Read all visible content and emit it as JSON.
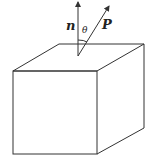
{
  "diagram": {
    "labels": {
      "normal": "n",
      "angle": "θ",
      "vector": "P"
    },
    "colors": {
      "stroke": "#333333",
      "background": "#ffffff"
    }
  }
}
